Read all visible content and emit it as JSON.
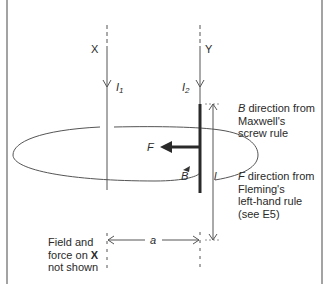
{
  "diagram": {
    "wires": [
      {
        "name": "X",
        "current_label": "I",
        "current_sub": "1"
      },
      {
        "name": "Y",
        "current_label": "I",
        "current_sub": "2"
      }
    ],
    "labels": {
      "force": "F",
      "field": "B",
      "length": "l",
      "separation": "a"
    },
    "notes": {
      "b_rule": {
        "symbol": "B",
        "lines": [
          " direction from",
          "Maxwell's",
          "screw rule"
        ]
      },
      "f_rule": {
        "symbol": "F",
        "lines": [
          " direction from",
          "Fleming's",
          "left-hand rule",
          "(see E5)"
        ]
      },
      "x_note": {
        "lines": [
          "Field and",
          "force on ",
          "not shown"
        ],
        "bold": "X"
      }
    },
    "colors": {
      "line": "#555555",
      "thick": "#2a2a2a",
      "text": "#2a2a2a",
      "border": "#666666"
    }
  }
}
